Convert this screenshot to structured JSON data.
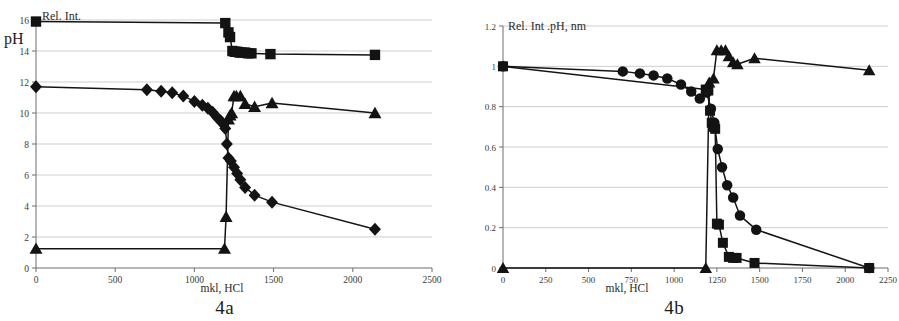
{
  "figure": {
    "panels": [
      {
        "caption": "4a",
        "title": "Rel. Int.",
        "y_axis_label": "pH",
        "x_axis_label": "mkl, HCl"
      },
      {
        "caption": "4b",
        "title": "Rel. Int .pH, nm",
        "x_axis_label": "mkl, HCl"
      }
    ]
  },
  "chart_data": [
    {
      "type": "line",
      "id": "4a",
      "title": "Rel. Int.",
      "caption": "4a",
      "xlabel": "mkl, HCl",
      "ylabel": "pH",
      "xlim": [
        0,
        2500
      ],
      "ylim": [
        0,
        16
      ],
      "xticks": [
        0,
        500,
        1000,
        1500,
        2000,
        2500
      ],
      "xtick_labels": [
        "0",
        "500",
        "1000",
        "1500",
        "2000",
        "2500"
      ],
      "yticks": [
        0,
        2,
        4,
        6,
        8,
        10,
        12,
        14,
        16
      ],
      "ytick_labels": [
        "0",
        "2",
        "4",
        "6",
        "8",
        "10",
        "12",
        "14",
        "16"
      ],
      "grid": true,
      "legend": "none",
      "series": [
        {
          "name": "squares",
          "marker": "square",
          "x": [
            0,
            1195,
            1215,
            1225,
            1240,
            1255,
            1270,
            1285,
            1300,
            1320,
            1340,
            1360,
            1480,
            2140
          ],
          "y": [
            15.9,
            15.8,
            15.2,
            14.9,
            14.0,
            13.95,
            13.95,
            13.9,
            13.9,
            13.9,
            13.85,
            13.85,
            13.8,
            13.75
          ]
        },
        {
          "name": "diamonds",
          "marker": "diamond",
          "x": [
            0,
            700,
            790,
            860,
            930,
            1000,
            1050,
            1085,
            1115,
            1145,
            1165,
            1180,
            1195,
            1205,
            1215,
            1230,
            1250,
            1270,
            1290,
            1320,
            1380,
            1490,
            2140
          ],
          "y": [
            11.7,
            11.5,
            11.4,
            11.3,
            11.1,
            10.75,
            10.5,
            10.3,
            10.05,
            9.7,
            9.5,
            9.3,
            9.0,
            8.0,
            7.1,
            6.9,
            6.5,
            6.1,
            5.7,
            5.2,
            4.7,
            4.25,
            2.5
          ]
        },
        {
          "name": "triangles",
          "marker": "triangle",
          "x": [
            0,
            1190,
            1200,
            1215,
            1225,
            1235,
            1250,
            1265,
            1290,
            1320,
            1380,
            1490,
            2140
          ],
          "y": [
            1.25,
            1.25,
            3.3,
            9.6,
            9.85,
            10.0,
            11.1,
            11.1,
            11.1,
            10.6,
            10.4,
            10.65,
            10.0
          ]
        }
      ]
    },
    {
      "type": "line",
      "id": "4b",
      "title": "Rel. Int .pH, nm",
      "caption": "4b",
      "xlabel": "mkl, HCl",
      "ylabel": "",
      "xlim": [
        0,
        2250
      ],
      "ylim": [
        0,
        1.2
      ],
      "xticks": [
        0,
        250,
        500,
        750,
        1000,
        1250,
        1500,
        1750,
        2000,
        2250
      ],
      "xtick_labels": [
        "0",
        "250",
        "500",
        "750",
        "1000",
        "1250",
        "1500",
        "1750",
        "2000",
        "2250"
      ],
      "yticks": [
        0,
        0.2,
        0.4,
        0.6,
        0.8,
        1,
        1.2
      ],
      "ytick_labels": [
        "0",
        "0.2",
        "0.4",
        "0.6",
        "0.8",
        "1",
        "1.2"
      ],
      "grid": true,
      "legend": "none",
      "series": [
        {
          "name": "circles",
          "marker": "circle",
          "x": [
            0,
            700,
            800,
            880,
            960,
            1040,
            1100,
            1150,
            1190,
            1215,
            1235,
            1255,
            1280,
            1310,
            1345,
            1385,
            1480,
            2140
          ],
          "y": [
            1.0,
            0.975,
            0.965,
            0.955,
            0.94,
            0.91,
            0.875,
            0.84,
            0.87,
            0.79,
            0.72,
            0.59,
            0.5,
            0.41,
            0.35,
            0.26,
            0.19,
            0.0
          ]
        },
        {
          "name": "squares",
          "marker": "square",
          "x": [
            0,
            1185,
            1200,
            1210,
            1220,
            1230,
            1240,
            1250,
            1262,
            1285,
            1320,
            1345,
            1365,
            1470,
            2140
          ],
          "y": [
            1.0,
            0.885,
            0.88,
            0.78,
            0.72,
            0.7,
            0.69,
            0.22,
            0.215,
            0.125,
            0.055,
            0.05,
            0.05,
            0.025,
            0.0
          ]
        },
        {
          "name": "triangles",
          "marker": "triangle",
          "x": [
            0,
            1185,
            1205,
            1230,
            1250,
            1275,
            1300,
            1320,
            1345,
            1370,
            1470,
            2140
          ],
          "y": [
            0.0,
            0.0,
            0.92,
            0.94,
            1.08,
            1.08,
            1.08,
            1.05,
            1.02,
            1.01,
            1.04,
            0.98
          ]
        }
      ]
    }
  ]
}
